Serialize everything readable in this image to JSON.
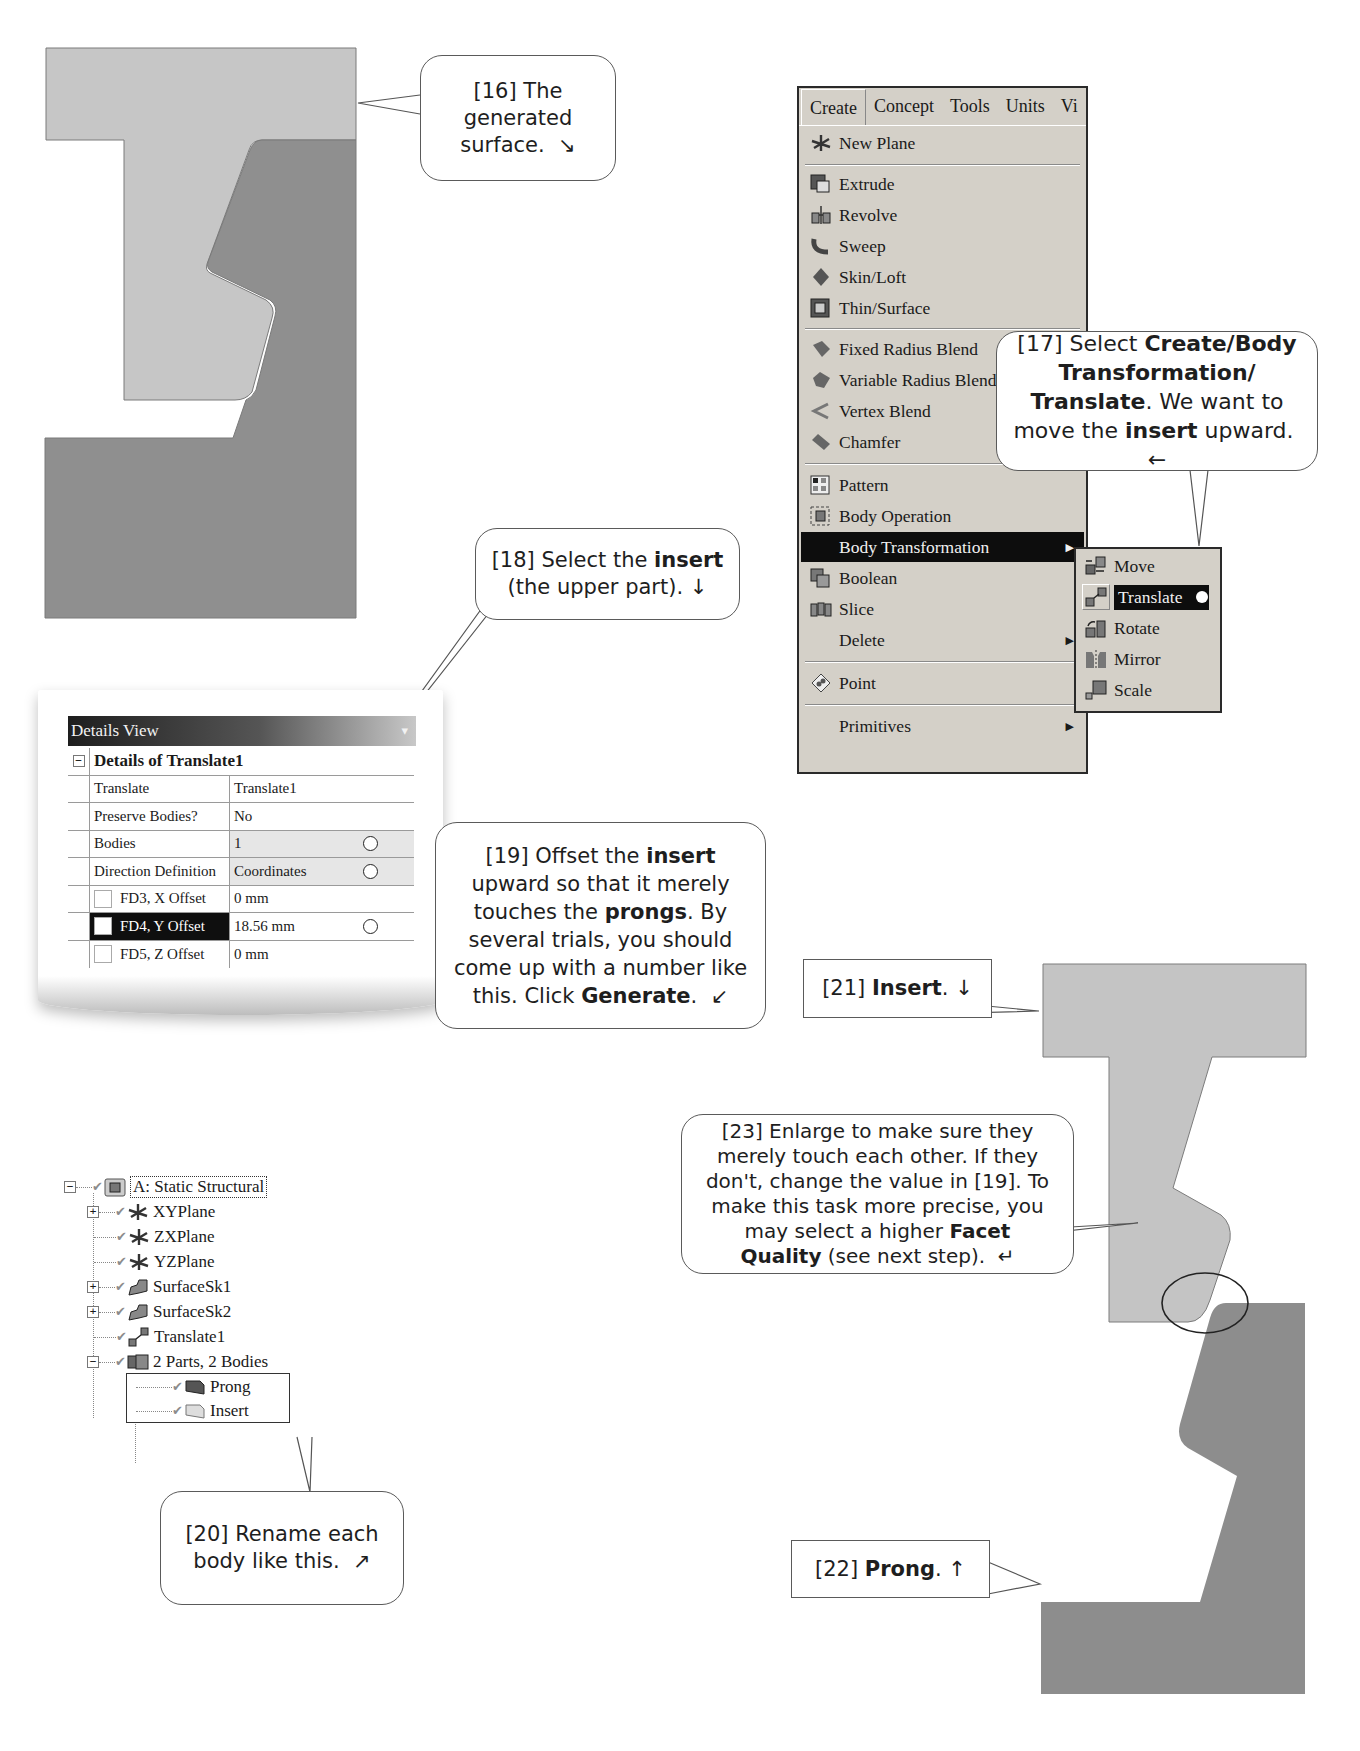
{
  "callouts": {
    "c16": {
      "num": "[16]",
      "text_lines": [
        "The",
        "generated",
        "surface."
      ],
      "arrow": "↘"
    },
    "c17": {
      "num": "[17]",
      "pre": "Select ",
      "bold1": "Create/Body",
      "bold2": "Transformation/",
      "bold3": "Translate",
      "mid": ". We want to",
      "line4_pre": "move the ",
      "line4_bold": "insert",
      "line4_post": " upward.",
      "arrow": "←"
    },
    "c18": {
      "num": "[18]",
      "pre": "Select the ",
      "bold": "insert",
      "line2": "(the upper part).",
      "arrow": "↓"
    },
    "c19": {
      "num": "[19]",
      "l1_pre": "Offset the ",
      "l1_bold": "insert",
      "l2": "upward so that it merely",
      "l3_pre": "touches the ",
      "l3_bold": "prongs",
      "l3_post": ".  By",
      "l4": "several trials, you should",
      "l5": "come up with a number like",
      "l6_pre": "this.  Click ",
      "l6_bold": "Generate",
      "l6_post": ".",
      "arrow": "↙"
    },
    "c20": {
      "num": "[20]",
      "l1": "Rename each",
      "l2": "body like this.",
      "arrow": "↗"
    },
    "c21": {
      "num": "[21]",
      "bold": "Insert",
      "post": ".",
      "arrow": "↓"
    },
    "c22": {
      "num": "[22]",
      "bold": "Prong",
      "post": ".",
      "arrow": "↑"
    },
    "c23": {
      "num": "[23]",
      "l1": "Enlarge to make sure they",
      "l2": "merely touch each other.  If they",
      "l3": "don't, change the value in [19].  To",
      "l4": "make this task more precise, you",
      "l5_pre": "may select a higher ",
      "l5_bold": "Facet",
      "l6_bold": "Quality",
      "l6_post": " (see next step).",
      "arrow": "↵"
    }
  },
  "menu": {
    "bar": [
      "Create",
      "Concept",
      "Tools",
      "Units",
      "Vi"
    ],
    "items": [
      {
        "label": "New Plane",
        "icon": "new-plane-icon"
      },
      {
        "label": "Extrude",
        "icon": "extrude-icon"
      },
      {
        "label": "Revolve",
        "icon": "revolve-icon"
      },
      {
        "label": "Sweep",
        "icon": "sweep-icon"
      },
      {
        "label": "Skin/Loft",
        "icon": "skin-loft-icon"
      },
      {
        "label": "Thin/Surface",
        "icon": "thin-surface-icon"
      },
      {
        "label": "Fixed Radius Blend",
        "icon": "fixed-radius-blend-icon"
      },
      {
        "label": "Variable Radius Blend",
        "icon": "variable-radius-blend-icon"
      },
      {
        "label": "Vertex Blend",
        "icon": "vertex-blend-icon"
      },
      {
        "label": "Chamfer",
        "icon": "chamfer-icon"
      },
      {
        "label": "Pattern",
        "icon": "pattern-icon"
      },
      {
        "label": "Body Operation",
        "icon": "body-operation-icon"
      },
      {
        "label": "Body Transformation",
        "icon": "",
        "submenu": true
      },
      {
        "label": "Boolean",
        "icon": "boolean-icon"
      },
      {
        "label": "Slice",
        "icon": "slice-icon"
      },
      {
        "label": "Delete",
        "icon": "",
        "submenu": true
      },
      {
        "label": "Point",
        "icon": "point-icon"
      },
      {
        "label": "Primitives",
        "icon": "",
        "submenu": true
      }
    ],
    "submenu": [
      {
        "label": "Move",
        "icon": "move-icon"
      },
      {
        "label": "Translate",
        "icon": "translate-icon"
      },
      {
        "label": "Rotate",
        "icon": "rotate-icon"
      },
      {
        "label": "Mirror",
        "icon": "mirror-icon"
      },
      {
        "label": "Scale",
        "icon": "scale-icon"
      }
    ]
  },
  "details_view": {
    "title": "Details View",
    "pin": "📌",
    "header": "Details of Translate1",
    "rows": [
      {
        "key": "Translate",
        "value": "Translate1"
      },
      {
        "key": "Preserve Bodies?",
        "value": "No"
      },
      {
        "key": "Bodies",
        "value": "1"
      },
      {
        "key": "Direction Definition",
        "value": "Coordinates"
      },
      {
        "key": "FD3, X Offset",
        "value": "0 mm"
      },
      {
        "key": "FD4, Y Offset",
        "value": "18.56 mm"
      },
      {
        "key": "FD5, Z Offset",
        "value": "0 mm"
      }
    ]
  },
  "tree": {
    "root": "A: Static Structural",
    "items": [
      "XYPlane",
      "ZXPlane",
      "YZPlane",
      "SurfaceSk1",
      "SurfaceSk2",
      "Translate1",
      "2 Parts, 2 Bodies"
    ],
    "bodies": [
      "Prong",
      "Insert"
    ]
  },
  "colors": {
    "insert": "#c4c4c4",
    "prong": "#8e8e8e",
    "menu_bg": "#d4d0c8",
    "highlight": "#0d0d0d"
  }
}
